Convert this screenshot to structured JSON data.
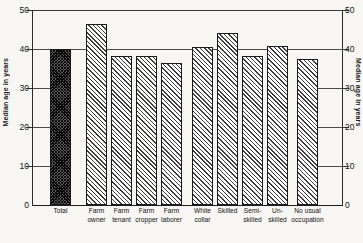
{
  "chart_data": {
    "type": "bar",
    "title": "",
    "subtitle": "",
    "xlabel": "",
    "ylabel": "Median age in years",
    "ylabel_right": "Median age in years",
    "ylim": [
      0,
      50
    ],
    "yticks": [
      0,
      10,
      20,
      30,
      40,
      50
    ],
    "ytick_labels": [
      "0",
      "10",
      "20",
      "30",
      "40",
      "50"
    ],
    "grid": true,
    "grid_emphasis_value": 40,
    "legend": "none",
    "categories": [
      "Total",
      "Farm owner",
      "Farm tenant",
      "Farm cropper",
      "Farm laborer",
      "White collar",
      "Skilled",
      "Semi-skilled",
      "Un-skilled",
      "No usual occupation"
    ],
    "category_lines": [
      [
        "Total"
      ],
      [
        "Farm",
        "owner"
      ],
      [
        "Farm",
        "tenant"
      ],
      [
        "Farm",
        "cropper"
      ],
      [
        "Farm",
        "laborer"
      ],
      [
        "White",
        "collar"
      ],
      [
        "Skilled"
      ],
      [
        "Semi-",
        "skilled"
      ],
      [
        "Un-",
        "skilled"
      ],
      [
        "No usual",
        "occupation"
      ]
    ],
    "values": [
      40.0,
      46.5,
      38.2,
      38.2,
      36.5,
      40.5,
      44.0,
      38.3,
      40.8,
      37.5
    ],
    "bar_styles": [
      "cross-hatch-dark",
      "diagonal-hatch",
      "diagonal-hatch",
      "diagonal-hatch",
      "diagonal-hatch",
      "diagonal-hatch",
      "diagonal-hatch",
      "diagonal-hatch",
      "diagonal-hatch",
      "diagonal-hatch"
    ],
    "colors": {
      "background": "#f7f6f3",
      "axis": "#1f1f1f",
      "grid": "#4a4a4a",
      "bar_outline": "#1a1a1a",
      "bar_fill": "#ffffff",
      "bar_hatch": "#3d3d3d",
      "total_bar_fill": "#5a5a5a",
      "text": "#111111"
    }
  }
}
